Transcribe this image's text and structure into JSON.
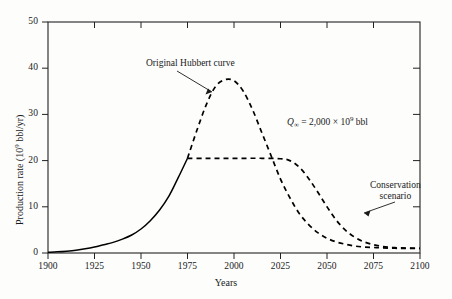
{
  "chart_data": {
    "type": "line",
    "title": "",
    "xlabel": "Years",
    "ylabel": "Production rate (10⁹ bbl/yr)",
    "xlim": [
      1900,
      2100
    ],
    "ylim": [
      0,
      50
    ],
    "xticks": [
      1900,
      1925,
      1950,
      1975,
      2000,
      2025,
      2050,
      2075,
      2100
    ],
    "yticks": [
      0,
      10,
      20,
      30,
      40,
      50
    ],
    "grid": false,
    "legend_position": "inline-annotations",
    "annotations": [
      {
        "name": "original-hubbert-curve-label",
        "text": "Original Hubbert curve",
        "x": 1972,
        "y": 42.5
      },
      {
        "name": "q-infinity-label",
        "text": "Q∞ = 2,000 × 10⁹ bbl",
        "x": 2030,
        "y": 30.5
      },
      {
        "name": "conservation-scenario-label",
        "text": "Conservation scenario",
        "x": 2075,
        "y": 16.5
      }
    ],
    "series": [
      {
        "name": "Historical production",
        "style": "solid",
        "x": [
          1900,
          1905,
          1910,
          1915,
          1920,
          1925,
          1930,
          1935,
          1940,
          1945,
          1950,
          1955,
          1960,
          1965,
          1970,
          1975
        ],
        "values": [
          0.15,
          0.25,
          0.4,
          0.6,
          0.9,
          1.3,
          1.8,
          2.3,
          3.0,
          3.9,
          5.2,
          7.0,
          9.3,
          12.3,
          16.3,
          20.5
        ]
      },
      {
        "name": "Original Hubbert curve",
        "style": "dashed",
        "x": [
          1975,
          1980,
          1985,
          1990,
          1995,
          2000,
          2005,
          2010,
          2015,
          2020,
          2025,
          2030,
          2035,
          2040,
          2045,
          2050,
          2055,
          2060,
          2065,
          2070,
          2075,
          2080,
          2090,
          2100
        ],
        "values": [
          20.5,
          26.5,
          32.0,
          36.0,
          37.5,
          37.3,
          35.0,
          31.0,
          26.0,
          21.0,
          16.0,
          12.0,
          8.6,
          6.2,
          4.4,
          3.2,
          2.4,
          1.9,
          1.5,
          1.3,
          1.2,
          1.1,
          1.0,
          1.0
        ]
      },
      {
        "name": "Conservation scenario",
        "style": "dashed",
        "x": [
          1975,
          1985,
          1995,
          2005,
          2015,
          2025,
          2030,
          2035,
          2040,
          2045,
          2050,
          2055,
          2060,
          2065,
          2070,
          2075,
          2080,
          2085,
          2090,
          2100
        ],
        "values": [
          20.5,
          20.5,
          20.5,
          20.5,
          20.5,
          20.4,
          20.0,
          18.6,
          16.2,
          13.2,
          10.0,
          7.1,
          4.9,
          3.4,
          2.4,
          1.8,
          1.4,
          1.2,
          1.1,
          1.0
        ]
      }
    ]
  },
  "axis": {
    "y_tick_labels": [
      "0",
      "10",
      "20",
      "30",
      "40",
      "50"
    ],
    "x_tick_labels": [
      "1900",
      "1925",
      "1950",
      "1975",
      "2000",
      "2025",
      "2050",
      "2075",
      "2100"
    ],
    "x_axis_title": "Years",
    "y_axis_title_prefix": "Production rate (10",
    "y_axis_title_sup": "9",
    "y_axis_title_suffix": " bbl/yr)"
  },
  "labels": {
    "hubbert": "Original Hubbert curve",
    "conservation_line1": "Conservation",
    "conservation_line2": "scenario",
    "q_symbol": "Q",
    "q_subscript": "∞",
    "q_equals": " = 2,000 × 10",
    "q_exponent": "9",
    "q_unit": " bbl"
  },
  "colors": {
    "axis": "#222222",
    "curve": "#000000",
    "background": "#fdfdfc",
    "text": "#1a1a1a"
  }
}
